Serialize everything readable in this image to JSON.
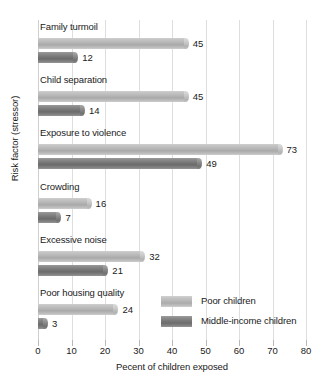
{
  "chart_data": {
    "type": "bar",
    "orientation": "horizontal",
    "title": "",
    "xlabel": "Pecent of children exposed",
    "ylabel": "Risk factor (stressor)",
    "xlim": [
      0,
      80
    ],
    "xticks": [
      0,
      10,
      20,
      30,
      40,
      50,
      60,
      70,
      80
    ],
    "grid": "vertical",
    "legend_position": "inside-bottom-right",
    "categories": [
      "Family turmoil",
      "Child separation",
      "Exposure to violence",
      "Crowding",
      "Excessive noise",
      "Poor housing quality"
    ],
    "series": [
      {
        "name": "Poor children",
        "color": "#b6b6b6",
        "values": [
          45,
          45,
          73,
          16,
          32,
          24
        ]
      },
      {
        "name": "Middle-income children",
        "color": "#777777",
        "values": [
          12,
          14,
          49,
          7,
          21,
          3
        ]
      }
    ]
  },
  "legend": {
    "items": [
      {
        "label": "Poor children"
      },
      {
        "label": "Middle-income children"
      }
    ]
  }
}
